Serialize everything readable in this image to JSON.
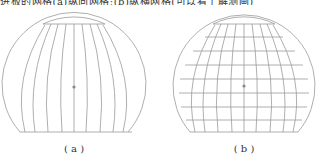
{
  "top_text": "进板的网格(a)纵向网格;(b)纵横网格(可以看了解测画)",
  "figures": [
    {
      "id": "a",
      "label": "( a )",
      "description": "Vertical meridian grid only"
    },
    {
      "id": "b",
      "label": "( b )",
      "description": "Meridian and horizontal grid"
    }
  ],
  "colors": {
    "line": "#9a9a9a",
    "dot": "#888888",
    "text": "#333333"
  }
}
